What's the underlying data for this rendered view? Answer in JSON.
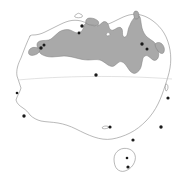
{
  "figure": {
    "kind": "distribution-map",
    "region_name": "Australia",
    "width_px": 185,
    "height_px": 176,
    "background_color": "#ffffff"
  },
  "legend_colors": {
    "range_fill": "#a9a9a9",
    "range_outline": "#7d7d7d",
    "coastline": "#8a8a8a",
    "land_fill": "#ffffff",
    "city_marker": "#1a1a1a",
    "latitude_line": "#c9c9c9"
  },
  "graticule": {
    "lines": [
      {
        "name": "tropic-of-capricorn",
        "label": "",
        "path": "M 18,80 C 60,76 120,75 172,79"
      }
    ]
  },
  "mainland": {
    "name": "australia-mainland",
    "path": "M 30,36 C 27,42 24,50 21,58 C 18,64 16,70 17,76 C 18,80 20,84 21,88 C 20,92 17,96 16,100 C 17,104 20,106 23,108 C 26,110 28,112 30,115 C 33,118 37,120 41,121 C 46,122 52,122 58,123 C 64,124 70,126 76,129 C 82,132 88,135 94,137 C 100,139 106,140 112,139 C 118,138 124,136 130,133 C 136,130 141,126 146,121 C 151,116 155,110 158,104 C 161,98 163,92 165,86 C 167,80 169,74 170,68 C 171,62 171,56 170,50 C 169,44 167,38 164,33 C 161,28 157,24 153,21 C 149,18 145,16 141,15 C 137,14 133,14 129,15 C 125,16 121,18 117,20 C 113,22 109,24 105,25 C 101,26 97,26 93,25 C 89,24 85,22 81,21 C 77,20 73,20 69,21 C 65,22 61,24 57,26 C 53,28 49,30 45,32 C 41,34 37,35 33,35 C 32,35 31,35 30,36 Z"
  },
  "islands": [
    {
      "name": "tasmania",
      "path": "M 119,150 C 116,152 114,155 114,159 C 114,163 115,167 117,169 C 119,171 122,172 125,171 C 128,170 131,168 133,165 C 135,162 136,158 135,155 C 134,152 132,150 129,149 C 126,148 122,148 119,150 Z"
    },
    {
      "name": "melville-island",
      "path": "M 77,14 C 75,15 74,16 75,17 C 77,18 80,18 82,17 C 83,16 82,14 80,14 C 79,13 78,13 77,14 Z"
    },
    {
      "name": "groote-eylandt",
      "path": "M 107,33 C 106,34 106,35 107,36 C 109,36 110,35 110,34 C 110,33 108,32 107,33 Z"
    },
    {
      "name": "kangaroo-island",
      "path": "M 106,126 C 104,126 102,127 102,128 C 103,129 106,129 108,128 C 109,127 108,126 106,126 Z"
    },
    {
      "name": "fraser-island",
      "path": "M 166,84 C 165,86 165,89 166,91 C 167,91 168,89 168,87 C 168,85 167,84 166,84 Z"
    }
  ],
  "range": {
    "name": "species-distribution-range",
    "description_label": "",
    "polygons": [
      {
        "name": "range-northern-main",
        "path": "M 38,48 C 36,45 37,42 40,41 C 44,40 48,41 51,39 C 54,37 56,34 59,32 C 62,30 66,29 70,30 C 73,31 75,33 78,33 C 80,33 82,31 83,29 C 84,27 84,24 86,23 C 88,22 90,24 92,25 C 94,26 96,27 98,26 C 100,25 101,23 103,22 C 105,21 107,22 108,24 C 109,26 109,29 111,30 C 113,31 115,29 117,28 C 119,27 121,27 122,29 C 123,31 122,34 123,36 C 124,38 126,37 127,35 C 128,32 128,28 130,25 C 131,22 133,19 135,17 C 137,15 139,15 140,17 C 141,20 141,24 142,28 C 143,32 145,35 147,37 C 149,39 152,40 154,42 C 156,44 157,47 158,50 C 159,53 159,56 158,58 C 157,60 155,61 153,60 C 151,59 150,57 148,56 C 146,55 144,56 143,58 C 142,61 142,64 141,67 C 140,70 138,72 136,73 C 134,74 132,73 130,71 C 128,69 127,66 125,64 C 123,62 121,61 119,62 C 117,63 116,65 114,66 C 112,67 110,66 108,65 C 105,63 103,61 100,60 C 96,59 92,60 88,60 C 84,60 80,59 76,58 C 72,57 68,56 64,56 C 60,56 56,57 52,57 C 48,57 44,56 41,54 C 39,52 38,50 38,48 Z"
      },
      {
        "name": "range-kimberley-lobe",
        "path": "M 38,48 C 35,47 32,47 30,49 C 28,51 28,54 30,55 C 32,56 35,55 37,54 C 39,53 40,51 40,49 C 40,48 39,48 38,48 Z"
      },
      {
        "name": "range-cape-york-tip",
        "path": "M 134,16 C 133,13 134,11 136,11 C 138,11 139,13 139,16 C 139,18 138,19 136,19 C 135,19 134,18 134,16 Z"
      },
      {
        "name": "range-arnhem-north",
        "path": "M 86,23 C 85,20 87,18 90,18 C 93,18 96,19 98,21 C 99,22 99,24 98,25 C 96,26 93,25 91,25 C 89,25 87,24 86,23 Z"
      },
      {
        "name": "range-east-coast-strip",
        "path": "M 155,44 C 157,42 160,42 162,44 C 164,46 165,49 164,52 C 163,54 161,54 159,52 C 157,50 155,47 155,44 Z"
      }
    ]
  },
  "cities": [
    {
      "name": "city-broome",
      "label": "",
      "cx": 41,
      "cy": 48,
      "r": 1.7
    },
    {
      "name": "city-derby",
      "label": "",
      "cx": 44,
      "cy": 45,
      "r": 1.5
    },
    {
      "name": "city-darwin",
      "label": "",
      "cx": 82,
      "cy": 26,
      "r": 1.7
    },
    {
      "name": "city-katherine",
      "label": "",
      "cx": 79,
      "cy": 33,
      "r": 1.4
    },
    {
      "name": "city-cairns",
      "label": "",
      "cx": 142,
      "cy": 44,
      "r": 1.7
    },
    {
      "name": "city-townsville",
      "label": "",
      "cx": 147,
      "cy": 49,
      "r": 1.5
    },
    {
      "name": "city-alice-springs",
      "label": "",
      "cx": 96,
      "cy": 75,
      "r": 1.7
    },
    {
      "name": "city-perth",
      "label": "",
      "cx": 24,
      "cy": 116,
      "r": 1.7
    },
    {
      "name": "city-adelaide",
      "label": "",
      "cx": 110,
      "cy": 127,
      "r": 1.6
    },
    {
      "name": "city-melbourne",
      "label": "",
      "cx": 133,
      "cy": 140,
      "r": 1.6
    },
    {
      "name": "city-sydney",
      "label": "",
      "cx": 161,
      "cy": 127,
      "r": 1.7
    },
    {
      "name": "city-brisbane",
      "label": "",
      "cx": 168,
      "cy": 98,
      "r": 1.6
    },
    {
      "name": "city-hobart",
      "label": "",
      "cx": 128,
      "cy": 167,
      "r": 1.6
    },
    {
      "name": "city-launceston",
      "label": "",
      "cx": 127,
      "cy": 158,
      "r": 1.3
    },
    {
      "name": "city-geraldton",
      "label": "",
      "cx": 17,
      "cy": 93,
      "r": 1.3
    }
  ],
  "chart_data": {
    "type": "map",
    "title": "",
    "subtitle": "",
    "xlabel": "",
    "ylabel": "",
    "annotations": [],
    "legend_entries": [
      {
        "label": "",
        "swatch": "#a9a9a9"
      }
    ],
    "series": [
      {
        "name": "distribution-range",
        "geometry": "polygon",
        "coverage_description": "tropical northern Australia: Kimberley, Top End, Gulf of Carpentaria, Cape York and north-east Queensland coast"
      },
      {
        "name": "locality-points",
        "geometry": "point",
        "count": 15
      }
    ]
  }
}
